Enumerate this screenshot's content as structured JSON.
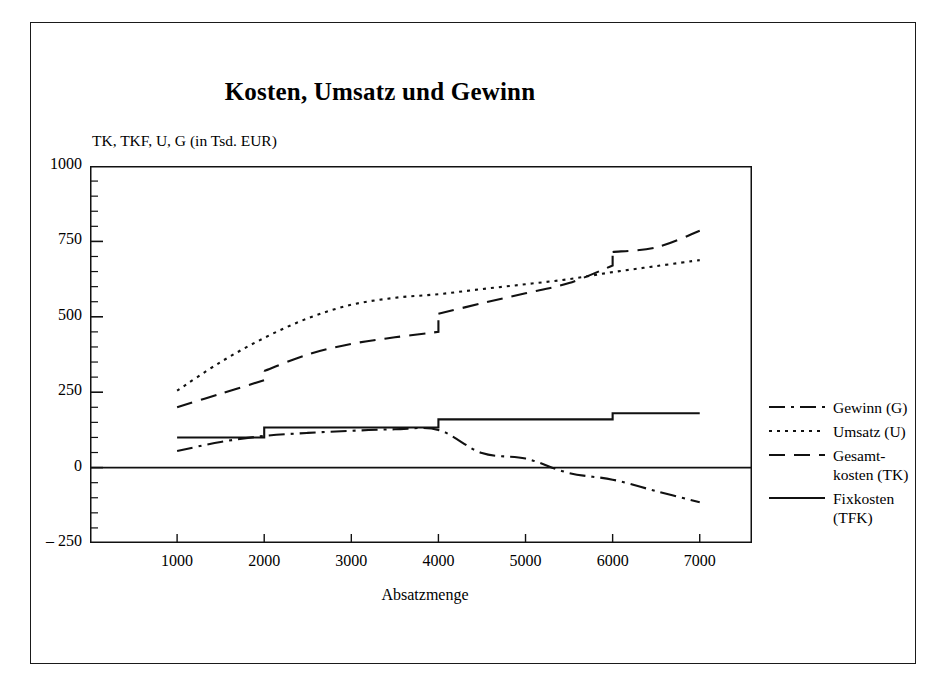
{
  "figure": {
    "title": "Kosten, Umsatz und Gewinn",
    "y_axis_caption": "TK, TKF, U, G (in Tsd. EUR)",
    "x_axis_caption": "Absatzmenge"
  },
  "legend": {
    "items": [
      {
        "label": "Gewinn (G)",
        "style": "dash-dot",
        "key": "G"
      },
      {
        "label": "Umsatz (U)",
        "style": "dotted",
        "key": "U"
      },
      {
        "label": "Gesamt-\nkosten (TK)",
        "style": "long-dash",
        "key": "TK"
      },
      {
        "label": "Fixkosten\n(TFK)",
        "style": "solid",
        "key": "TFK"
      }
    ]
  },
  "chart_data": {
    "type": "line",
    "title": "Kosten, Umsatz und Gewinn",
    "xlabel": "Absatzmenge",
    "ylabel": "TK, TKF, U, G (in Tsd. EUR)",
    "xlim": [
      0,
      7600
    ],
    "ylim": [
      -250,
      1000
    ],
    "xticks": [
      1000,
      2000,
      3000,
      4000,
      5000,
      6000,
      7000
    ],
    "xtick_labels": [
      "1000",
      "2000",
      "3000",
      "4000",
      "5000",
      "6000",
      "7000"
    ],
    "yticks": [
      -250,
      0,
      250,
      500,
      750,
      1000
    ],
    "ytick_labels": [
      "– 250",
      "0",
      "250",
      "500",
      "750",
      "1000"
    ],
    "y_minor_tick_step": 50,
    "grid": false,
    "legend_position": "right",
    "zero_line": true,
    "x": [
      1000,
      1500,
      2000,
      2500,
      3000,
      3500,
      4000,
      4500,
      5000,
      5500,
      6000,
      6500,
      7000
    ],
    "series": [
      {
        "name": "Umsatz (U)",
        "key": "U",
        "style": "dotted",
        "values": [
          255,
          350,
          430,
          495,
          540,
          563,
          575,
          592,
          608,
          625,
          648,
          668,
          688
        ]
      },
      {
        "name": "Gesamtkosten (TK)",
        "key": "TK",
        "style": "long-dash",
        "step_points": [
          {
            "x": 2000,
            "from": 290,
            "to": 320
          },
          {
            "x": 4000,
            "from": 450,
            "to": 510
          },
          {
            "x": 6000,
            "from": 670,
            "to": 715
          }
        ],
        "values": [
          200,
          245,
          290,
          375,
          410,
          432,
          450,
          545,
          578,
          612,
          670,
          730,
          785
        ]
      },
      {
        "name": "Fixkosten (TFK)",
        "key": "TFK",
        "style": "solid",
        "step_levels": [
          {
            "x_from": 1000,
            "x_to": 2000,
            "value": 100
          },
          {
            "x_from": 2000,
            "x_to": 4000,
            "value": 133
          },
          {
            "x_from": 4000,
            "x_to": 6000,
            "value": 160
          },
          {
            "x_from": 6000,
            "x_to": 7000,
            "value": 180
          }
        ],
        "values": [
          100,
          100,
          133,
          133,
          133,
          133,
          160,
          160,
          160,
          160,
          180,
          180,
          180
        ]
      },
      {
        "name": "Gewinn (G)",
        "key": "G",
        "style": "dash-dot",
        "zero_crossing_x": 5050,
        "values": [
          55,
          85,
          105,
          115,
          122,
          127,
          125,
          48,
          30,
          -18,
          -40,
          -78,
          -115
        ]
      }
    ]
  }
}
